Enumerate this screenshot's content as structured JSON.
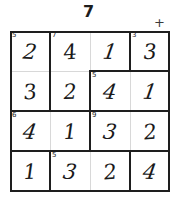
{
  "header": {
    "title": "7",
    "plus_marker": "+"
  },
  "grid": {
    "rows": 4,
    "cols": 4,
    "cells": [
      {
        "id": "r1c1",
        "clue": "5",
        "value": "2"
      },
      {
        "id": "r1c2",
        "clue": "7",
        "value": "4"
      },
      {
        "id": "r1c3",
        "clue": "",
        "value": "1"
      },
      {
        "id": "r1c4",
        "clue": "3",
        "value": "3"
      },
      {
        "id": "r2c1",
        "clue": "",
        "value": "3"
      },
      {
        "id": "r2c2",
        "clue": "",
        "value": "2"
      },
      {
        "id": "r2c3",
        "clue": "5",
        "value": "4"
      },
      {
        "id": "r2c4",
        "clue": "",
        "value": "1"
      },
      {
        "id": "r3c1",
        "clue": "6",
        "value": "4"
      },
      {
        "id": "r3c2",
        "clue": "",
        "value": "1"
      },
      {
        "id": "r3c3",
        "clue": "9",
        "value": "3"
      },
      {
        "id": "r3c4",
        "clue": "",
        "value": "2"
      },
      {
        "id": "r4c1",
        "clue": "",
        "value": "1"
      },
      {
        "id": "r4c2",
        "clue": "5",
        "value": "3"
      },
      {
        "id": "r4c3",
        "clue": "",
        "value": "2"
      },
      {
        "id": "r4c4",
        "clue": "",
        "value": "4"
      }
    ]
  },
  "colors": {
    "ink": "#1a1a1a",
    "cage_border": "#1e1e1e",
    "cell_border": "#d8d8d8",
    "background": "#ffffff"
  }
}
